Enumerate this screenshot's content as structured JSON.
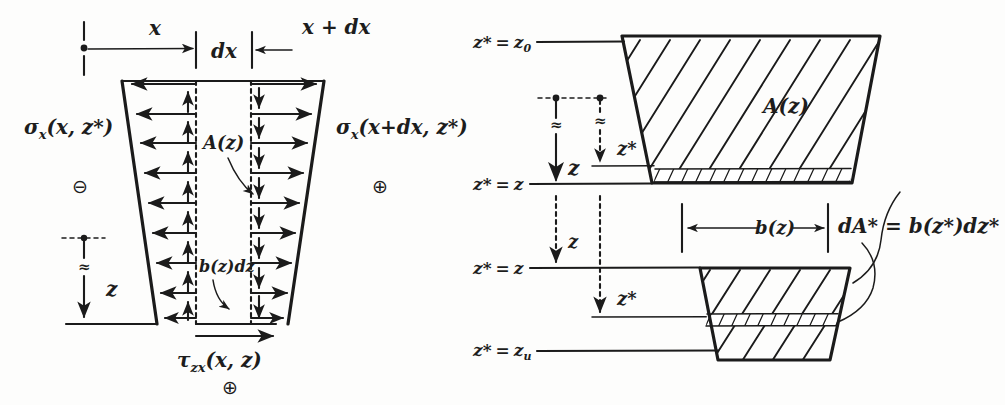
{
  "figure": {
    "style": "hand-drawn pencil sketch, black ink on white paper",
    "ink_color": "#1b1b1b",
    "paper_color": "#fdfdfc"
  },
  "left_panel": {
    "name": "stress-element-panel",
    "dimensions": {
      "x_label": "x",
      "dx_label": "dx",
      "x_plus_dx_label": "x + dx"
    },
    "stress_labels": {
      "left_stress": "σ",
      "left_stress_sub": "x",
      "left_stress_args": "(x, z*)",
      "right_stress": "σ",
      "right_stress_sub": "x",
      "right_stress_args": "(x+dx, z*)",
      "shear_stress": "τ",
      "shear_stress_sub": "zx",
      "shear_stress_args": "(x, z)"
    },
    "sign_left": "⊖",
    "sign_right": "⊕",
    "sign_bottom": "⊕",
    "area_label": "A(z)",
    "strip_label": "b(z)dz",
    "depth_label": "z",
    "break_symbol": "≈",
    "left_arrow_count": 8,
    "right_arrow_count": 8
  },
  "right_panel": {
    "name": "cross-section-panel",
    "levels": [
      {
        "id": "z-star-z0",
        "label_lhs": "z*",
        "label_eq": "=",
        "label_rhs": "z",
        "label_sub": "0",
        "full": "z* = z₀"
      },
      {
        "id": "z-star-z-upper",
        "label_lhs": "z*",
        "label_eq": "=",
        "label_rhs": "z",
        "label_sub": "",
        "full": "z* = z"
      },
      {
        "id": "z-star-z-lower",
        "label_lhs": "z*",
        "label_eq": "=",
        "label_rhs": "z",
        "label_sub": "",
        "full": "z* = z"
      },
      {
        "id": "z-star-zu",
        "label_lhs": "z*",
        "label_eq": "=",
        "label_rhs": "z",
        "label_sub": "u",
        "full": "z* = zᵤ"
      }
    ],
    "area_label": "A(z)",
    "width_label": "b(z)",
    "differential_area_label": "dA* = b(z*)dz*",
    "depth_label": "z",
    "depth_star_label": "z*",
    "break_symbol": "≈",
    "hatch_direction": "diagonal-up-right",
    "band_label_target": "dA*"
  }
}
